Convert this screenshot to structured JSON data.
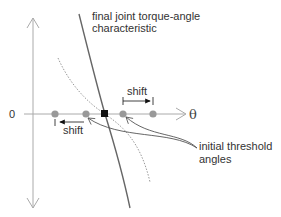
{
  "diagram": {
    "title_label_line1": "final joint torque-angle",
    "title_label_line2": "characteristic",
    "origin_label": "0",
    "x_axis_label": "θ",
    "shift_right_label": "shift",
    "shift_left_label": "shift",
    "annotation_line1": "initial threshold",
    "annotation_line2": "angles",
    "colors": {
      "axis": "#aaaaaa",
      "curve_solid": "#666666",
      "curve_dotted": "#999999",
      "dot": "#999999",
      "intersection": "#111111",
      "text": "#333333"
    },
    "threshold_points": [
      {
        "name": "left-outer",
        "x": 55
      },
      {
        "name": "left-inner",
        "x": 86
      },
      {
        "name": "right-inner",
        "x": 123
      },
      {
        "name": "right-outer",
        "x": 153
      }
    ]
  }
}
